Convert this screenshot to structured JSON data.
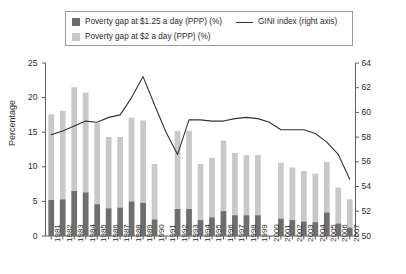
{
  "legend": {
    "items": [
      {
        "label": "Poverty gap at $1.25 a day (PPP) (%)",
        "color": "#6e6e6e",
        "type": "swatch"
      },
      {
        "label": "Poverty gap at $2 a day (PPP) (%)",
        "color": "#c9c9c9",
        "type": "swatch"
      },
      {
        "label": "GINI index (right axis)",
        "color": "#333333",
        "type": "line"
      }
    ]
  },
  "axes": {
    "left_title": "Percentage",
    "left_ticks": [
      "0",
      "5",
      "10",
      "15",
      "20",
      "25"
    ],
    "right_ticks": [
      "50",
      "52",
      "54",
      "56",
      "58",
      "60",
      "62",
      "64"
    ],
    "left_min": 0,
    "left_max": 25,
    "right_min": 50,
    "right_max": 64
  },
  "chart_data": {
    "type": "bar",
    "title": "",
    "xlabel": "",
    "ylabel": "Percentage",
    "ylabel_right": "GINI index",
    "ylim": [
      0,
      25
    ],
    "ylim_right": [
      50,
      64
    ],
    "grid": false,
    "legend_position": "top",
    "categories": [
      "1981",
      "1982",
      "1983",
      "1984",
      "1985",
      "1986",
      "1987",
      "1988",
      "1989",
      "1990",
      "1991",
      "1992",
      "1993",
      "1994",
      "1995",
      "1996",
      "1997",
      "1998",
      "1999",
      "2000",
      "2001",
      "2002",
      "2003",
      "2004",
      "2005",
      "2006",
      "2007"
    ],
    "series": [
      {
        "name": "Poverty gap at $1.25 a day (PPP) (%)",
        "type": "bar-stacked-bottom",
        "color": "#6e6e6e",
        "values": [
          5.2,
          5.3,
          6.5,
          6.3,
          4.6,
          4.0,
          4.1,
          5.0,
          4.8,
          2.4,
          null,
          3.9,
          3.9,
          2.3,
          2.7,
          3.6,
          3.0,
          3.0,
          3.0,
          null,
          2.5,
          2.3,
          2.1,
          2.0,
          3.4,
          1.8,
          1.2
        ]
      },
      {
        "name": "Poverty gap at $2 a day (PPP) (%)",
        "type": "bar-stacked-top",
        "color": "#c9c9c9",
        "values": [
          12.4,
          12.8,
          15.0,
          14.4,
          11.7,
          10.3,
          10.2,
          12.1,
          11.9,
          8.0,
          null,
          11.3,
          11.3,
          8.1,
          8.6,
          10.2,
          9.0,
          8.7,
          8.7,
          null,
          8.1,
          7.6,
          7.3,
          7.0,
          7.3,
          5.2,
          4.1
        ]
      },
      {
        "name": "GINI index (right axis)",
        "type": "line",
        "color": "#333333",
        "axis": "right",
        "values": [
          58.2,
          58.5,
          58.9,
          59.3,
          59.2,
          59.6,
          59.8,
          61.2,
          62.9,
          60.6,
          58.4,
          56.6,
          59.4,
          59.4,
          59.3,
          59.3,
          59.5,
          59.6,
          59.5,
          59.2,
          58.6,
          58.6,
          58.6,
          58.3,
          57.6,
          56.6,
          54.6
        ]
      }
    ]
  }
}
